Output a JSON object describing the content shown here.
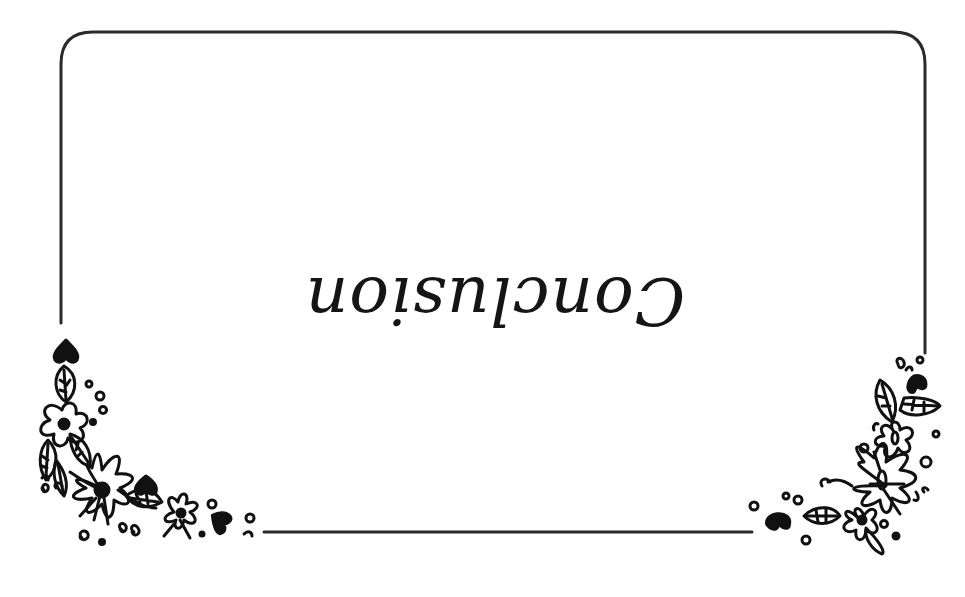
{
  "card": {
    "title": "Conclusion",
    "title_rotation_deg": 180,
    "border_color": "#2a2a2a",
    "ink_color": "#111111",
    "background": "#ffffff"
  },
  "decorations": {
    "bottom_left": "floral-corner",
    "bottom_right": "floral-corner"
  }
}
